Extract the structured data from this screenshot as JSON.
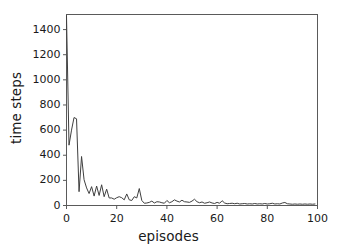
{
  "chart_data": {
    "type": "line",
    "title": "",
    "xlabel": "episodes",
    "ylabel": "time steps",
    "xlim": [
      0,
      100
    ],
    "ylim": [
      0,
      1520
    ],
    "xticks": [
      0,
      20,
      40,
      60,
      80,
      100
    ],
    "yticks": [
      0,
      200,
      400,
      600,
      800,
      1000,
      1200,
      1400
    ],
    "grid": false,
    "legend": null,
    "line_color": "#3f3f3f",
    "line_width": 1.0,
    "series": [
      {
        "name": "time steps per episode",
        "x": [
          0,
          1,
          2,
          3,
          4,
          5,
          6,
          7,
          8,
          9,
          10,
          11,
          12,
          13,
          14,
          15,
          16,
          17,
          18,
          19,
          20,
          21,
          22,
          23,
          24,
          25,
          26,
          27,
          28,
          29,
          30,
          31,
          32,
          33,
          34,
          35,
          36,
          37,
          38,
          39,
          40,
          41,
          42,
          43,
          44,
          45,
          46,
          47,
          48,
          49,
          50,
          51,
          52,
          53,
          54,
          55,
          56,
          57,
          58,
          59,
          60,
          61,
          62,
          63,
          64,
          65,
          66,
          67,
          68,
          69,
          70,
          71,
          72,
          73,
          74,
          75,
          76,
          77,
          78,
          79,
          80,
          81,
          82,
          83,
          84,
          85,
          86,
          87,
          88,
          89,
          90,
          91,
          92,
          93,
          94,
          95,
          96,
          97,
          98,
          99
        ],
        "values": [
          1510,
          480,
          600,
          700,
          690,
          110,
          390,
          205,
          140,
          95,
          150,
          75,
          155,
          80,
          165,
          70,
          130,
          60,
          60,
          50,
          62,
          70,
          62,
          45,
          92,
          45,
          40,
          70,
          60,
          135,
          40,
          18,
          20,
          25,
          35,
          20,
          30,
          28,
          22,
          18,
          40,
          22,
          30,
          45,
          35,
          28,
          42,
          30,
          28,
          25,
          35,
          50,
          30,
          22,
          28,
          18,
          22,
          28,
          20,
          16,
          25,
          18,
          38,
          20,
          14,
          16,
          18,
          14,
          18,
          12,
          14,
          16,
          12,
          14,
          12,
          16,
          12,
          14,
          12,
          16,
          12,
          14,
          18,
          12,
          14,
          12,
          20,
          24,
          14,
          12,
          10,
          12,
          10,
          12,
          10,
          12,
          10,
          12,
          10,
          12
        ]
      }
    ]
  },
  "axis": {
    "ytick_labels": [
      "0",
      "200",
      "400",
      "600",
      "800",
      "1000",
      "1200",
      "1400"
    ],
    "xtick_labels": [
      "0",
      "20",
      "40",
      "60",
      "80",
      "100"
    ]
  },
  "colors": {
    "line": "#3f3f3f",
    "frame": "#5a5a5a",
    "text": "#1a1a1a",
    "background": "#ffffff"
  }
}
